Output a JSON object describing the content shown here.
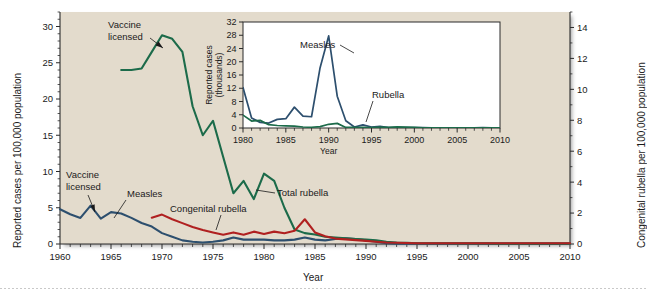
{
  "figure": {
    "background_color": "#e3dbcc",
    "page_color": "#ffffff"
  },
  "main_axes": {
    "y_left_label": "Reported cases per 100,000 population",
    "y_right_label": "Congenital rubella per 100,000 population",
    "x_label": "Year",
    "x_ticks": [
      "1960",
      "1965",
      "1970",
      "1975",
      "1980",
      "1985",
      "1990",
      "1995",
      "2000",
      "2005",
      "2010"
    ],
    "y_left_ticks": [
      "0",
      "5",
      "10",
      "15",
      "20",
      "25",
      "30"
    ],
    "y_right_ticks": [
      "0",
      "2",
      "4",
      "6",
      "8",
      "10",
      "12",
      "14"
    ]
  },
  "annotations": {
    "vaccine_licensed_rubella": "Vaccine\nlicensed",
    "vaccine_licensed_rubella_line1": "Vaccine",
    "vaccine_licensed_rubella_line2": "licensed",
    "vaccine_licensed_measles_line1": "Vaccine",
    "vaccine_licensed_measles_line2": "licensed",
    "measles_label": "Measles",
    "congenital_rubella_label": "Congenital rubella",
    "total_rubella_label": "Total rubella"
  },
  "inset_axes": {
    "y_label_line1": "Reported cases",
    "y_label_line2": "(thousands)",
    "x_label": "Year",
    "x_ticks": [
      "1980",
      "1985",
      "1990",
      "1995",
      "2000",
      "2005",
      "2010"
    ],
    "y_ticks": [
      "0",
      "4",
      "8",
      "12",
      "16",
      "20",
      "24",
      "28",
      "32"
    ],
    "measles_label": "Measles",
    "rubella_label": "Rubella"
  },
  "colors": {
    "measles": "#2d4f6e",
    "total_rubella": "#1c6b4a",
    "congenital_rubella": "#b02020",
    "axis": "#2b2b2b",
    "plot_bg": "#e3dbcc",
    "inset_bg": "#ffffff"
  },
  "chart_data": {
    "type": "line",
    "title": "",
    "xlabel": "Year",
    "ylabel": "Reported cases per 100,000 population",
    "y2label": "Congenital rubella per 100,000 population",
    "xlim": [
      1960,
      2010
    ],
    "ylim": [
      0,
      32
    ],
    "y2lim": [
      0,
      15
    ],
    "grid": false,
    "legend": "inline-annotations",
    "series": [
      {
        "name": "Measles",
        "color": "#2d4f6e",
        "axis": "left",
        "x": [
          1960,
          1961,
          1962,
          1963,
          1964,
          1965,
          1966,
          1967,
          1968,
          1969,
          1970,
          1971,
          1972,
          1973,
          1974,
          1975,
          1976,
          1977,
          1978,
          1979,
          1980,
          1981,
          1982,
          1983,
          1984,
          1985,
          1986,
          1987,
          1988,
          1989,
          1990,
          1991,
          1992,
          1993,
          1994,
          1995,
          1996,
          1997,
          1998,
          1999,
          2000,
          2001,
          2002,
          2003,
          2004,
          2005,
          2006,
          2007,
          2008,
          2009,
          2010
        ],
        "y": [
          4.8,
          4.1,
          3.6,
          5.3,
          3.5,
          4.4,
          4.2,
          3.6,
          2.9,
          2.4,
          1.5,
          1.0,
          0.5,
          0.3,
          0.2,
          0.3,
          0.5,
          0.9,
          0.6,
          0.6,
          0.6,
          0.5,
          0.5,
          0.6,
          0.9,
          0.6,
          0.5,
          0.7,
          0.8,
          0.7,
          0.5,
          0.3,
          0.1,
          0.05,
          0.05,
          0.05,
          0.05,
          0.05,
          0.05,
          0.05,
          0.05,
          0.05,
          0.05,
          0.05,
          0.05,
          0.05,
          0.05,
          0.05,
          0.05,
          0.05,
          0.05
        ]
      },
      {
        "name": "Total rubella",
        "color": "#1c6b4a",
        "axis": "left",
        "x": [
          1966,
          1967,
          1968,
          1969,
          1970,
          1971,
          1972,
          1973,
          1974,
          1975,
          1976,
          1977,
          1978,
          1979,
          1980,
          1981,
          1982,
          1983,
          1984,
          1985,
          1986,
          1987,
          1988,
          1989,
          1990,
          1991,
          1992,
          1993,
          1994,
          1995,
          1996,
          1997,
          1998,
          1999,
          2000,
          2001,
          2002,
          2003,
          2004,
          2005,
          2006,
          2007,
          2008,
          2009,
          2010
        ],
        "y": [
          24.0,
          24.0,
          24.2,
          26.5,
          28.8,
          28.3,
          26.5,
          19.0,
          15.0,
          17.0,
          12.0,
          7.0,
          8.7,
          6.2,
          9.7,
          8.7,
          5.0,
          2.0,
          1.5,
          1.3,
          1.0,
          0.9,
          0.8,
          0.7,
          0.6,
          0.5,
          0.3,
          0.2,
          0.15,
          0.1,
          0.1,
          0.1,
          0.1,
          0.08,
          0.08,
          0.08,
          0.08,
          0.05,
          0.05,
          0.05,
          0.05,
          0.05,
          0.05,
          0.05,
          0.05
        ]
      },
      {
        "name": "Congenital rubella",
        "color": "#b02020",
        "axis": "right",
        "x": [
          1969,
          1970,
          1971,
          1972,
          1973,
          1974,
          1975,
          1976,
          1977,
          1978,
          1979,
          1980,
          1981,
          1982,
          1983,
          1984,
          1985,
          1986,
          1987,
          1988,
          1989,
          1990,
          1991,
          1992,
          1993,
          1994,
          1995,
          1996,
          1997,
          1998,
          1999,
          2000,
          2001,
          2002,
          2003,
          2004,
          2005,
          2006,
          2007,
          2008,
          2009,
          2010
        ],
        "y": [
          1.7,
          1.9,
          1.6,
          1.35,
          1.1,
          0.9,
          0.75,
          0.6,
          0.75,
          0.6,
          0.8,
          0.65,
          0.8,
          0.7,
          0.85,
          1.6,
          0.75,
          0.5,
          0.35,
          0.3,
          0.25,
          0.2,
          0.15,
          0.1,
          0.08,
          0.06,
          0.05,
          0.05,
          0.05,
          0.05,
          0.05,
          0.05,
          0.05,
          0.05,
          0.05,
          0.05,
          0.05,
          0.05,
          0.05,
          0.05,
          0.05,
          0.05
        ]
      }
    ],
    "inset": {
      "type": "line",
      "xlabel": "Year",
      "ylabel": "Reported cases (thousands)",
      "xlim": [
        1980,
        2010
      ],
      "ylim": [
        0,
        32
      ],
      "series": [
        {
          "name": "Measles",
          "color": "#2d4f6e",
          "x": [
            1980,
            1981,
            1982,
            1983,
            1984,
            1985,
            1986,
            1987,
            1988,
            1989,
            1990,
            1991,
            1992,
            1993,
            1994,
            1995,
            1996,
            1997,
            1998,
            1999,
            2000,
            2001,
            2002,
            2003,
            2004,
            2005,
            2006,
            2007,
            2008,
            2009,
            2010
          ],
          "y": [
            12.2,
            3.0,
            1.7,
            1.5,
            2.6,
            2.8,
            6.3,
            3.6,
            3.4,
            18.2,
            27.8,
            9.6,
            2.2,
            0.3,
            0.96,
            0.3,
            0.5,
            0.14,
            0.1,
            0.1,
            0.09,
            0.12,
            0.04,
            0.06,
            0.04,
            0.07,
            0.06,
            0.04,
            0.14,
            0.07,
            0.06
          ]
        },
        {
          "name": "Rubella",
          "color": "#1c6b4a",
          "x": [
            1980,
            1981,
            1982,
            1983,
            1984,
            1985,
            1986,
            1987,
            1988,
            1989,
            1990,
            1991,
            1992,
            1993,
            1994,
            1995,
            1996,
            1997,
            1998,
            1999,
            2000,
            2001,
            2002,
            2003,
            2004,
            2005,
            2006,
            2007,
            2008,
            2009,
            2010
          ],
          "y": [
            3.9,
            2.1,
            2.3,
            1.0,
            0.75,
            0.63,
            0.55,
            0.3,
            0.23,
            0.4,
            1.12,
            1.4,
            0.16,
            0.19,
            0.23,
            0.13,
            0.24,
            0.18,
            0.36,
            0.27,
            0.18,
            0.02,
            0.02,
            0.01,
            0.01,
            0.01,
            0.01,
            0.01,
            0.01,
            0.01,
            0.01
          ]
        }
      ]
    }
  }
}
